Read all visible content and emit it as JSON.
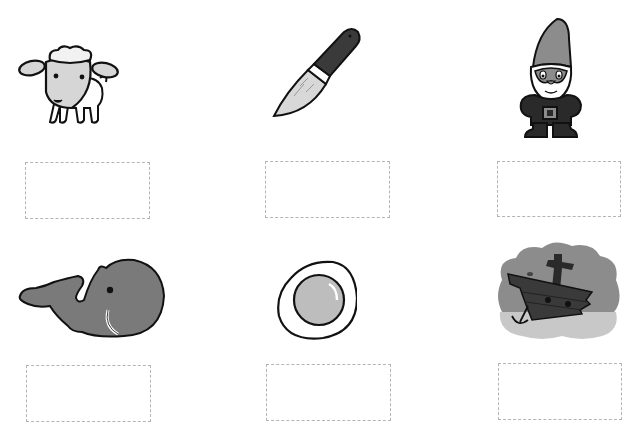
{
  "worksheet": {
    "items": [
      {
        "id": "sheep",
        "icon": "sheep-icon",
        "answer": "",
        "box": {
          "x": 25,
          "y": 162,
          "w": 125,
          "h": 57
        }
      },
      {
        "id": "knife",
        "icon": "knife-icon",
        "answer": "",
        "box": {
          "x": 265,
          "y": 161,
          "w": 125,
          "h": 57
        }
      },
      {
        "id": "gnome",
        "icon": "gnome-icon",
        "answer": "",
        "box": {
          "x": 497,
          "y": 161,
          "w": 124,
          "h": 56
        }
      },
      {
        "id": "whale",
        "icon": "whale-icon",
        "answer": "",
        "box": {
          "x": 26,
          "y": 365,
          "w": 125,
          "h": 57
        }
      },
      {
        "id": "egg",
        "icon": "fried-egg-icon",
        "answer": "",
        "box": {
          "x": 266,
          "y": 364,
          "w": 125,
          "h": 57
        }
      },
      {
        "id": "shipwreck",
        "icon": "shipwreck-icon",
        "answer": "",
        "box": {
          "x": 498,
          "y": 363,
          "w": 124,
          "h": 57
        }
      }
    ]
  },
  "colors": {
    "background": "#ffffff",
    "outline": "#111111",
    "light_gray": "#d6d6d6",
    "mid_gray": "#8c8c8c",
    "dark_gray": "#3a3a3a",
    "box_border": "#b4b4b4"
  }
}
